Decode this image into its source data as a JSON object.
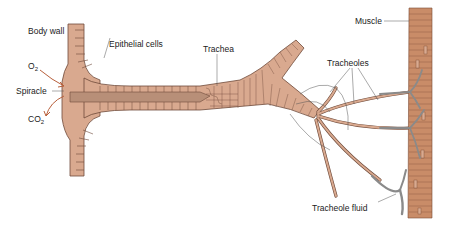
{
  "diagram": {
    "labels": {
      "body_wall": "Body wall",
      "epithelial_cells": "Epithelial cells",
      "trachea": "Trachea",
      "tracheoles": "Tracheoles",
      "muscle": "Muscle",
      "spiracle": "Spiracle",
      "o2": "O",
      "o2_sub": "2",
      "co2": "CO",
      "co2_sub": "2",
      "tracheole_fluid": "Tracheole fluid"
    },
    "colors": {
      "tissue": "#d9a98f",
      "tissue_dark": "#c29479",
      "lumen": "#b88f78",
      "outline": "#6e4a3a",
      "muscle": "#c98c68",
      "fluid": "#8a8a8a",
      "arrow": "#b8603c",
      "leader": "#555555"
    }
  }
}
